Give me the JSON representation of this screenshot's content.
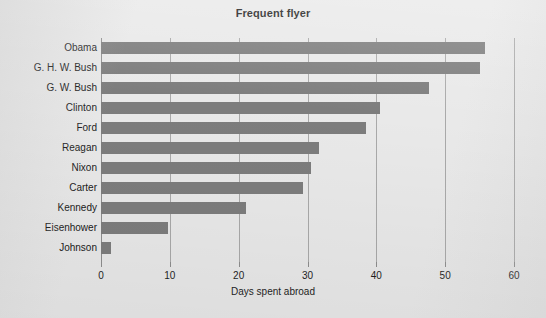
{
  "chart_data": {
    "type": "bar",
    "orientation": "horizontal",
    "title": "Frequent flyer",
    "xlabel": "Days spent abroad",
    "ylabel": "",
    "categories": [
      "Obama",
      "G. H. W. Bush",
      "G. W. Bush",
      "Clinton",
      "Ford",
      "Reagan",
      "Nixon",
      "Carter",
      "Kennedy",
      "Eisenhower",
      "Johnson"
    ],
    "values": [
      55.8,
      55.0,
      47.6,
      40.5,
      38.5,
      31.7,
      30.5,
      29.4,
      21.0,
      9.8,
      1.5
    ],
    "xlim": [
      0,
      60
    ],
    "ylim": null,
    "xticks": [
      0,
      10,
      20,
      30,
      40,
      50,
      60
    ],
    "xtick_labels": [
      "0",
      "10",
      "20",
      "30",
      "40",
      "50",
      "60"
    ],
    "grid": "vertical",
    "legend": null,
    "bar_color": "#7d7d7d",
    "background_color": "#e9e9e9",
    "gridline_color": "#a9a9a9"
  }
}
